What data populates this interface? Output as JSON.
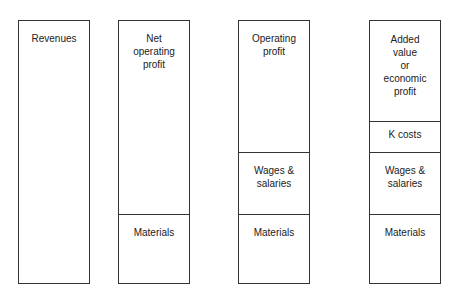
{
  "columns": [
    {
      "segments": [
        {
          "label": "Revenues"
        }
      ]
    },
    {
      "segments": [
        {
          "label": "Net\noperating\nprofit"
        },
        {
          "label": "Materials"
        }
      ]
    },
    {
      "segments": [
        {
          "label": "Operating\nprofit"
        },
        {
          "label": "Wages &\nsalaries"
        },
        {
          "label": "Materials"
        }
      ]
    },
    {
      "segments": [
        {
          "label": "Added\nvalue\nor\neconomic\nprofit"
        },
        {
          "label": "K costs"
        },
        {
          "label": "Wages &\nsalaries"
        },
        {
          "label": "Materials"
        }
      ]
    }
  ]
}
